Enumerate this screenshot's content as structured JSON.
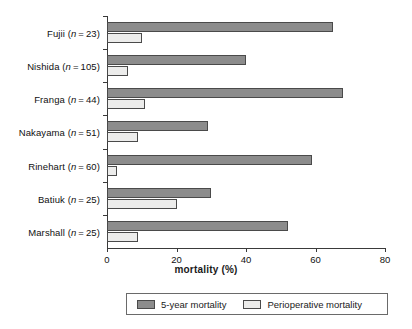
{
  "chart_data": {
    "type": "bar",
    "orientation": "horizontal",
    "title": "",
    "xlabel": "mortality (%)",
    "ylabel": "",
    "xlim": [
      0,
      80
    ],
    "xticks": [
      0,
      20,
      40,
      60,
      80
    ],
    "grid": false,
    "legend_position": "bottom",
    "categories": [
      "Fujii (n = 23)",
      "Nishida (n = 105)",
      "Franga (n = 44)",
      "Nakayama (n = 51)",
      "Rinehart (n = 60)",
      "Batiuk (n = 25)",
      "Marshall (n = 25)"
    ],
    "category_parts": [
      {
        "name": "Fujii",
        "n": "23"
      },
      {
        "name": "Nishida",
        "n": "105"
      },
      {
        "name": "Franga",
        "n": "44"
      },
      {
        "name": "Nakayama",
        "n": "51"
      },
      {
        "name": "Rinehart",
        "n": "60"
      },
      {
        "name": "Batiuk",
        "n": "25"
      },
      {
        "name": "Marshall",
        "n": "25"
      }
    ],
    "series": [
      {
        "name": "5-year mortality",
        "color": "#8c8c8c",
        "values": [
          65,
          40,
          68,
          29,
          59,
          30,
          52
        ]
      },
      {
        "name": "Perioperative mortality",
        "color": "#ececeb",
        "values": [
          10,
          6,
          11,
          9,
          3,
          20,
          9
        ]
      }
    ]
  },
  "legend": {
    "items": [
      {
        "label": "5-year mortality"
      },
      {
        "label": "Perioperative mortality"
      }
    ]
  },
  "axis": {
    "x_title": "mortality (%)",
    "tick_labels": [
      "0",
      "20",
      "40",
      "60",
      "80"
    ]
  }
}
